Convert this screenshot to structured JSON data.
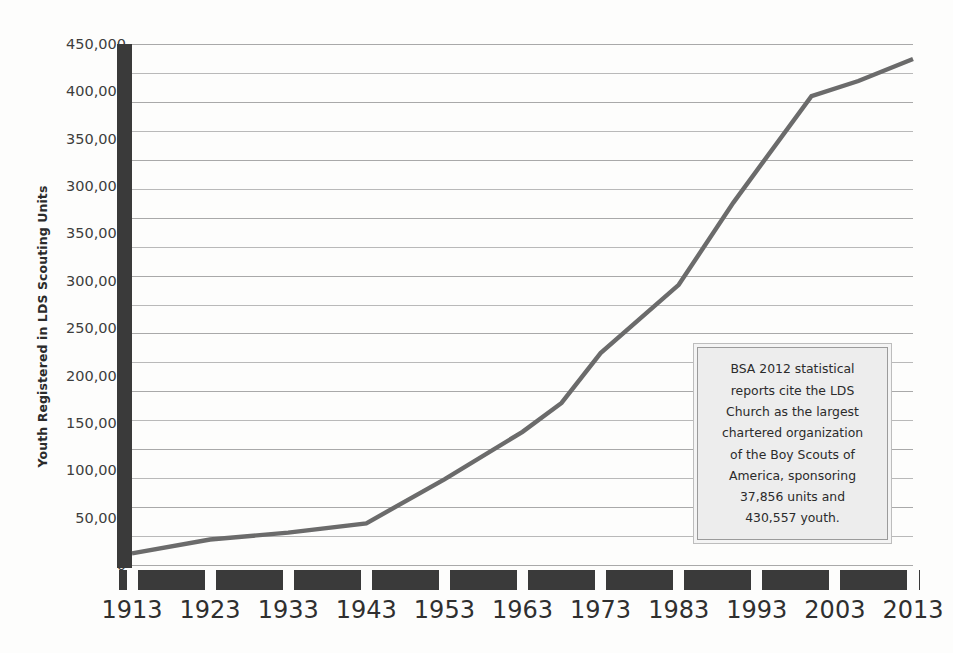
{
  "chart_data": {
    "type": "line",
    "title": "",
    "xlabel": "",
    "ylabel": "Youth Registered in LDS Scouting Units",
    "xlim": [
      1913,
      2013
    ],
    "ylim": [
      0,
      450000
    ],
    "grid": true,
    "grid_interval": 25000,
    "legend": "none",
    "line_color": "#6b6b6b",
    "axis_color": "#3a3a3a",
    "x_tick_labels": [
      "1913",
      "1923",
      "1933",
      "1943",
      "1953",
      "1963",
      "1973",
      "1983",
      "1993",
      "2003",
      "2013"
    ],
    "x_tick_values": [
      1913,
      1923,
      1933,
      1943,
      1953,
      1963,
      1973,
      1983,
      1993,
      2003,
      2013
    ],
    "y_tick_labels": [
      "450,000",
      "400,000",
      "350,000",
      "300,000",
      "350,000",
      "300,000",
      "250,000",
      "200,000",
      "150,000",
      "100,000",
      "50,000",
      "0"
    ],
    "y_tick_values": [
      450000,
      400000,
      350000,
      300000,
      250000,
      200000,
      250000,
      200000,
      150000,
      100000,
      50000,
      0
    ],
    "y_tick_positions": [
      450000,
      400000,
      350000,
      300000,
      250000,
      200000,
      175000,
      150000,
      125000,
      100000,
      50000,
      0
    ],
    "series": [
      {
        "name": "Youth Registered in LDS Scouting Units",
        "x": [
          1913,
          1923,
          1933,
          1943,
          1953,
          1963,
          1968,
          1973,
          1983,
          1990,
          2000,
          2006,
          2013
        ],
        "values": [
          10000,
          22000,
          28000,
          36000,
          74000,
          115000,
          140000,
          183000,
          242000,
          313000,
          405000,
          418000,
          437000
        ]
      }
    ],
    "annotations": [
      {
        "name": "bsa-2012-note",
        "text": "BSA 2012 statistical reports cite the LDS Church as the largest chartered organization of the Boy Scouts of America, sponsoring 37,856 units and 430,557 youth.",
        "lines": [
          "BSA 2012 statistical",
          "reports cite the LDS",
          "Church as the largest",
          "chartered organization",
          "of the Boy Scouts of",
          "America, sponsoring",
          "37,856 units and",
          "430,557 youth."
        ],
        "facts": {
          "report_year": "2012",
          "units": "37,856",
          "youth": "430,557",
          "organization": "LDS Church",
          "program": "Boy Scouts of America"
        }
      }
    ]
  }
}
